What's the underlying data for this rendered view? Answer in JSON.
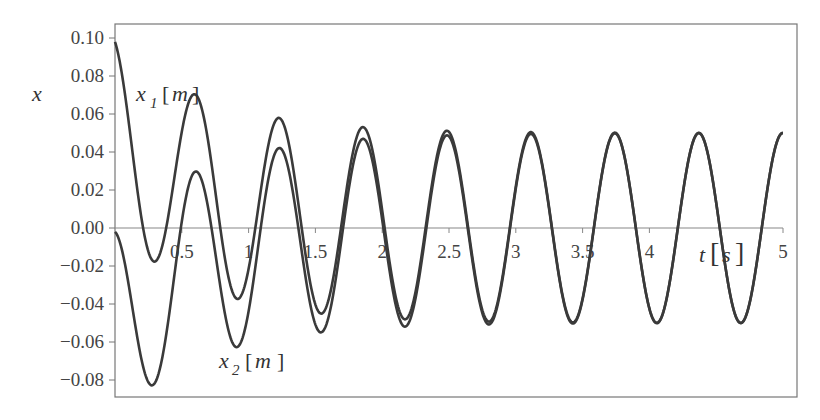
{
  "chart_data": {
    "type": "line",
    "title": "",
    "xlabel": "t [s]",
    "ylabel": "x",
    "xlim": [
      0,
      5
    ],
    "ylim": [
      -0.085,
      0.105
    ],
    "grid": false,
    "legend": "inline labels",
    "x_ticks": [
      "0.5",
      "1",
      "1.5",
      "2",
      "2.5",
      "3",
      "3.5",
      "4",
      "t [s]",
      "5"
    ],
    "x_tick_values": [
      0.5,
      1,
      1.5,
      2,
      2.5,
      3,
      3.5,
      4,
      5
    ],
    "y_ticks": [
      "0.10",
      "0.08",
      "0.06",
      "0.04",
      "0.02",
      "0.00",
      "-0.02",
      "-0.04",
      "-0.06",
      "-0.08"
    ],
    "y_tick_values": [
      0.1,
      0.08,
      0.06,
      0.04,
      0.02,
      0.0,
      -0.02,
      -0.04,
      -0.06,
      -0.08
    ],
    "series": [
      {
        "name": "x1 [m]",
        "key_points": [
          {
            "t": 0.0,
            "x": 0.1
          },
          {
            "t": 0.27,
            "x": -0.019
          },
          {
            "t": 0.6,
            "x": 0.07
          },
          {
            "t": 0.95,
            "x": -0.038
          },
          {
            "t": 1.25,
            "x": 0.057
          },
          {
            "t": 1.55,
            "x": -0.045
          },
          {
            "t": 1.88,
            "x": 0.053
          },
          {
            "t": 2.2,
            "x": -0.049
          },
          {
            "t": 2.51,
            "x": 0.051
          },
          {
            "t": 2.83,
            "x": -0.05
          },
          {
            "t": 3.14,
            "x": 0.05
          },
          {
            "t": 3.46,
            "x": -0.05
          },
          {
            "t": 3.77,
            "x": 0.05
          },
          {
            "t": 4.09,
            "x": -0.05
          },
          {
            "t": 4.4,
            "x": 0.05
          },
          {
            "t": 4.72,
            "x": -0.05
          },
          {
            "t": 5.0,
            "x": 0.047
          }
        ]
      },
      {
        "name": "x2 [m]",
        "key_points": [
          {
            "t": 0.0,
            "x": 0.0
          },
          {
            "t": 0.27,
            "x": -0.082
          },
          {
            "t": 0.6,
            "x": 0.03
          },
          {
            "t": 0.95,
            "x": -0.062
          },
          {
            "t": 1.25,
            "x": 0.042
          },
          {
            "t": 1.55,
            "x": -0.055
          },
          {
            "t": 1.88,
            "x": 0.047
          },
          {
            "t": 2.2,
            "x": -0.051
          },
          {
            "t": 2.51,
            "x": 0.049
          },
          {
            "t": 2.83,
            "x": -0.05
          },
          {
            "t": 3.14,
            "x": 0.05
          },
          {
            "t": 3.46,
            "x": -0.05
          },
          {
            "t": 3.77,
            "x": 0.05
          },
          {
            "t": 4.09,
            "x": -0.05
          },
          {
            "t": 4.4,
            "x": 0.05
          },
          {
            "t": 4.72,
            "x": -0.05
          },
          {
            "t": 5.0,
            "x": 0.047
          }
        ]
      }
    ],
    "model": {
      "steady_amplitude": 0.05,
      "omega": 10.0,
      "phase": 1.855,
      "transient_amplitude": 0.05,
      "decay": 1.5
    },
    "annotations": [
      {
        "text": "x1 [m]",
        "near_t": 0.25,
        "near_x": 0.085
      },
      {
        "text": "x2 [m]",
        "near_t": 1.0,
        "near_x": -0.072
      },
      {
        "text": "t [s]",
        "near_t": 4.3,
        "near_x": -0.015
      }
    ]
  },
  "labels": {
    "y_axis": "x",
    "x1_base": "x",
    "x1_sub": "1",
    "x2_base": "x",
    "x2_sub": "2",
    "unit_m": "m",
    "t_var": "t",
    "unit_s": "s"
  },
  "colors": {
    "line": "#3a3a3a",
    "axis": "#888888",
    "frame": "#777777",
    "text": "#333333"
  }
}
